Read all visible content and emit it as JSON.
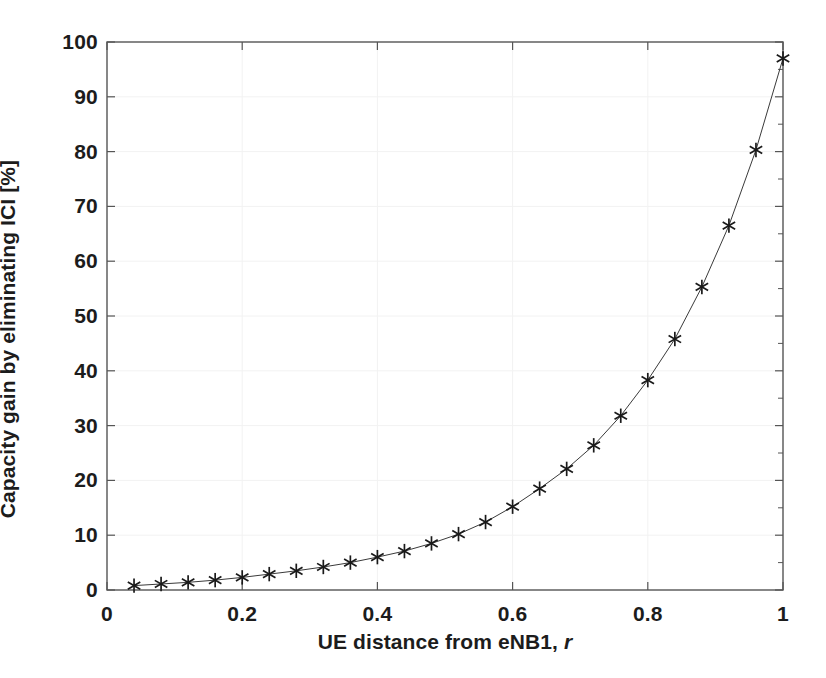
{
  "chart_data": {
    "type": "line",
    "title": "",
    "subtitle": "",
    "xlabel_prefix": "UE distance from eNB1,",
    "xlabel_variable": "r",
    "xlabel": "UE distance from eNB1, r",
    "ylabel": "Capacity gain by eliminating ICI [%]",
    "xlim": [
      0,
      1
    ],
    "ylim": [
      0,
      100
    ],
    "xticks": [
      0,
      0.2,
      0.4,
      0.6,
      0.8,
      1
    ],
    "xtick_labels": [
      "0",
      "0.2",
      "0.4",
      "0.6",
      "0.8",
      "1"
    ],
    "yticks": [
      0,
      10,
      20,
      30,
      40,
      50,
      60,
      70,
      80,
      90,
      100
    ],
    "ytick_labels": [
      "0",
      "10",
      "20",
      "30",
      "40",
      "50",
      "60",
      "70",
      "80",
      "90",
      "100"
    ],
    "grid": true,
    "grid_color": "#f2f2f2",
    "legend": null,
    "legend_position": "none",
    "marker": "asterisk",
    "marker_color": "#1a1a1a",
    "line_color": "#3a3a3a",
    "line_width": 1,
    "axis_color": "#555555",
    "background": "#ffffff",
    "x": [
      0.04,
      0.08,
      0.12,
      0.16,
      0.2,
      0.24,
      0.28,
      0.32,
      0.36,
      0.4,
      0.44,
      0.48,
      0.52,
      0.56,
      0.6,
      0.64,
      0.68,
      0.72,
      0.76,
      0.8,
      0.84,
      0.88,
      0.92,
      0.96,
      1.0
    ],
    "values": [
      0.8,
      1.1,
      1.4,
      1.8,
      2.3,
      2.9,
      3.5,
      4.2,
      5.0,
      6.0,
      7.1,
      8.5,
      10.2,
      12.4,
      15.2,
      18.5,
      22.1,
      26.4,
      31.8,
      38.3,
      45.8,
      55.3,
      66.5,
      80.3,
      97.0
    ],
    "series": [
      {
        "name": "Capacity gain",
        "x": [
          0.04,
          0.08,
          0.12,
          0.16,
          0.2,
          0.24,
          0.28,
          0.32,
          0.36,
          0.4,
          0.44,
          0.48,
          0.52,
          0.56,
          0.6,
          0.64,
          0.68,
          0.72,
          0.76,
          0.8,
          0.84,
          0.88,
          0.92,
          0.96,
          1.0
        ],
        "values": [
          0.8,
          1.1,
          1.4,
          1.8,
          2.3,
          2.9,
          3.5,
          4.2,
          5.0,
          6.0,
          7.1,
          8.5,
          10.2,
          12.4,
          15.2,
          18.5,
          22.1,
          26.4,
          31.8,
          38.3,
          45.8,
          55.3,
          66.5,
          80.3,
          97.0
        ]
      }
    ]
  }
}
